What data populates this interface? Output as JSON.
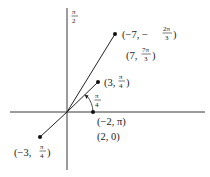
{
  "diagram": {
    "type": "polar-coordinate-plot",
    "axis_label_top": {
      "num": "π",
      "den": "2"
    },
    "angle_label": {
      "num": "π",
      "den": "4"
    },
    "points": [
      {
        "name": "point-a",
        "label_prefix": "(−7, −",
        "num": "2π",
        "den": "3",
        "suffix": ")",
        "alt_prefix": "(7, ",
        "alt_num": "7π",
        "alt_den": "3",
        "alt_suffix": ")"
      },
      {
        "name": "point-b",
        "label_prefix": "(3, ",
        "num": "π",
        "den": "4",
        "suffix": ")"
      },
      {
        "name": "point-c",
        "label": "(−2, π)",
        "alt_label": "(2, 0)"
      },
      {
        "name": "point-d",
        "label_prefix": "(−3, ",
        "num": "π",
        "den": "4",
        "suffix": ")"
      }
    ]
  }
}
